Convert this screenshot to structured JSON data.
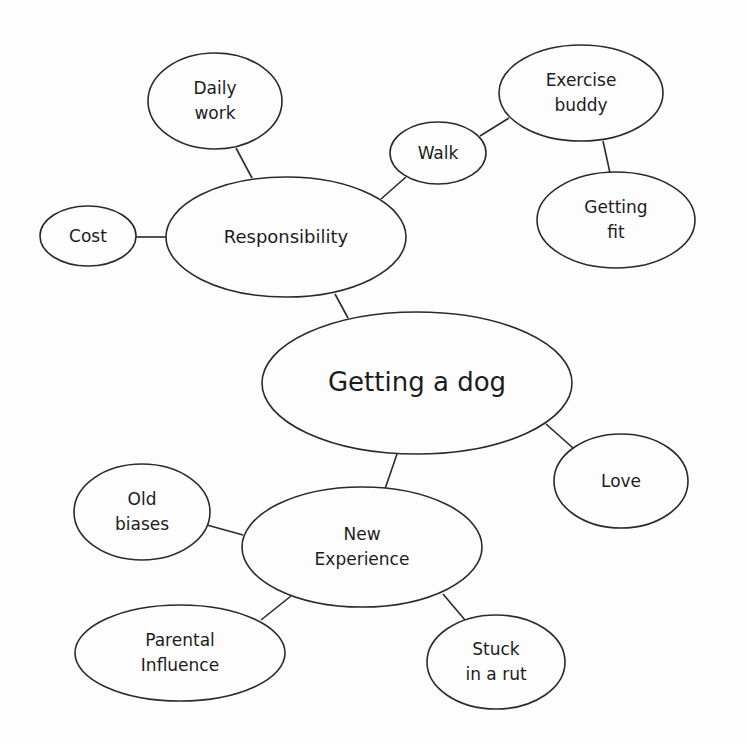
{
  "diagram": {
    "type": "mind-map",
    "title": "Getting a dog",
    "colors": {
      "background": "#fdfdfd",
      "stroke": "#2a2a2a",
      "text": "#1c1c1c"
    },
    "nodes": [
      {
        "id": "center",
        "lines": [
          "Getting a dog"
        ],
        "cx": 417,
        "cy": 383,
        "rx": 155,
        "ry": 71,
        "font": 26
      },
      {
        "id": "responsibility",
        "lines": [
          "Responsibility"
        ],
        "cx": 286,
        "cy": 237,
        "rx": 120,
        "ry": 60,
        "font": 18
      },
      {
        "id": "daily-work",
        "lines": [
          "Daily",
          "work"
        ],
        "cx": 215,
        "cy": 101,
        "rx": 67,
        "ry": 48,
        "font": 17
      },
      {
        "id": "cost",
        "lines": [
          "Cost"
        ],
        "cx": 88,
        "cy": 236,
        "rx": 48,
        "ry": 30,
        "font": 17
      },
      {
        "id": "walk",
        "lines": [
          "Walk"
        ],
        "cx": 438,
        "cy": 153,
        "rx": 48,
        "ry": 31,
        "font": 17
      },
      {
        "id": "exercise-buddy",
        "lines": [
          "Exercise",
          "buddy"
        ],
        "cx": 581,
        "cy": 93,
        "rx": 82,
        "ry": 48,
        "font": 17
      },
      {
        "id": "getting-fit",
        "lines": [
          "Getting",
          "fit"
        ],
        "cx": 616,
        "cy": 220,
        "rx": 79,
        "ry": 48,
        "font": 17
      },
      {
        "id": "love",
        "lines": [
          "Love"
        ],
        "cx": 621,
        "cy": 481,
        "rx": 67,
        "ry": 47,
        "font": 17
      },
      {
        "id": "new-experience",
        "lines": [
          "New",
          "Experience"
        ],
        "cx": 362,
        "cy": 547,
        "rx": 120,
        "ry": 60,
        "font": 17
      },
      {
        "id": "old-biases",
        "lines": [
          "Old",
          "biases"
        ],
        "cx": 142,
        "cy": 512,
        "rx": 68,
        "ry": 48,
        "font": 17
      },
      {
        "id": "parental-influence",
        "lines": [
          "Parental",
          "Influence"
        ],
        "cx": 180,
        "cy": 653,
        "rx": 105,
        "ry": 48,
        "font": 17
      },
      {
        "id": "stuck-in-a-rut",
        "lines": [
          "Stuck",
          "in a rut"
        ],
        "cx": 496,
        "cy": 662,
        "rx": 69,
        "ry": 47,
        "font": 17
      }
    ],
    "edges": [
      {
        "from": "center",
        "to": "responsibility",
        "x1": 348,
        "y1": 318,
        "x2": 335,
        "y2": 294
      },
      {
        "from": "responsibility",
        "to": "daily-work",
        "x1": 252,
        "y1": 178,
        "x2": 236,
        "y2": 148
      },
      {
        "from": "responsibility",
        "to": "cost",
        "x1": 166,
        "y1": 237,
        "x2": 136,
        "y2": 237
      },
      {
        "from": "responsibility",
        "to": "walk",
        "x1": 381,
        "y1": 199,
        "x2": 406,
        "y2": 177
      },
      {
        "from": "walk",
        "to": "exercise-buddy",
        "x1": 480,
        "y1": 136,
        "x2": 509,
        "y2": 118
      },
      {
        "from": "exercise-buddy",
        "to": "getting-fit",
        "x1": 603,
        "y1": 141,
        "x2": 610,
        "y2": 173
      },
      {
        "from": "center",
        "to": "love",
        "x1": 546,
        "y1": 424,
        "x2": 573,
        "y2": 448
      },
      {
        "from": "center",
        "to": "new-experience",
        "x1": 397,
        "y1": 454,
        "x2": 385,
        "y2": 489
      },
      {
        "from": "new-experience",
        "to": "old-biases",
        "x1": 243,
        "y1": 535,
        "x2": 207,
        "y2": 525
      },
      {
        "from": "new-experience",
        "to": "parental-influence",
        "x1": 291,
        "y1": 596,
        "x2": 261,
        "y2": 620
      },
      {
        "from": "new-experience",
        "to": "stuck-in-a-rut",
        "x1": 443,
        "y1": 594,
        "x2": 465,
        "y2": 620
      }
    ]
  }
}
